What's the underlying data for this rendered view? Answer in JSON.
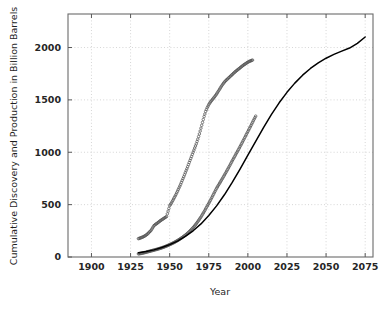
{
  "chart_data": {
    "type": "line",
    "title": "",
    "xlabel": "Year",
    "ylabel": "Cumulative Discovery and Production in Billion Barrels",
    "xlim": [
      1885,
      2080
    ],
    "ylim": [
      0,
      2320
    ],
    "xticks": [
      1900,
      1925,
      1950,
      1975,
      2000,
      2025,
      2050,
      2075
    ],
    "xtick_labels": [
      "1900",
      "1925",
      "1950",
      "1975",
      "2000",
      "2025",
      "2050",
      "2075"
    ],
    "yticks": [
      0,
      500,
      1000,
      1500,
      2000
    ],
    "ytick_labels": [
      "0",
      "500",
      "1000",
      "1500",
      "2000"
    ],
    "grid": "dotted-light-gray",
    "legend": "none",
    "series": [
      {
        "name": "Cumulative Discovery",
        "marker": "open-circle",
        "color": "#555555",
        "points": [
          [
            1930,
            175
          ],
          [
            1931,
            180
          ],
          [
            1932,
            186
          ],
          [
            1933,
            192
          ],
          [
            1934,
            200
          ],
          [
            1935,
            210
          ],
          [
            1936,
            222
          ],
          [
            1937,
            238
          ],
          [
            1938,
            252
          ],
          [
            1940,
            300
          ],
          [
            1941,
            312
          ],
          [
            1942,
            322
          ],
          [
            1943,
            334
          ],
          [
            1944,
            346
          ],
          [
            1945,
            356
          ],
          [
            1946,
            366
          ],
          [
            1947,
            376
          ],
          [
            1948,
            386
          ],
          [
            1950,
            490
          ],
          [
            1951,
            512
          ],
          [
            1952,
            540
          ],
          [
            1953,
            568
          ],
          [
            1954,
            596
          ],
          [
            1955,
            628
          ],
          [
            1956,
            660
          ],
          [
            1957,
            694
          ],
          [
            1958,
            730
          ],
          [
            1959,
            766
          ],
          [
            1960,
            804
          ],
          [
            1961,
            842
          ],
          [
            1962,
            882
          ],
          [
            1963,
            922
          ],
          [
            1964,
            960
          ],
          [
            1965,
            1000
          ],
          [
            1966,
            1040
          ],
          [
            1967,
            1080
          ],
          [
            1968,
            1125
          ],
          [
            1969,
            1175
          ],
          [
            1970,
            1230
          ],
          [
            1971,
            1285
          ],
          [
            1972,
            1340
          ],
          [
            1973,
            1390
          ],
          [
            1974,
            1425
          ],
          [
            1975,
            1455
          ],
          [
            1976,
            1478
          ],
          [
            1977,
            1497
          ],
          [
            1978,
            1516
          ],
          [
            1979,
            1535
          ],
          [
            1980,
            1556
          ],
          [
            1981,
            1580
          ],
          [
            1982,
            1604
          ],
          [
            1983,
            1628
          ],
          [
            1984,
            1650
          ],
          [
            1985,
            1670
          ],
          [
            1986,
            1686
          ],
          [
            1987,
            1700
          ],
          [
            1988,
            1714
          ],
          [
            1989,
            1728
          ],
          [
            1990,
            1742
          ],
          [
            1991,
            1756
          ],
          [
            1992,
            1770
          ],
          [
            1993,
            1782
          ],
          [
            1994,
            1794
          ],
          [
            1995,
            1806
          ],
          [
            1996,
            1818
          ],
          [
            1997,
            1830
          ],
          [
            1998,
            1840
          ],
          [
            1999,
            1850
          ],
          [
            2000,
            1860
          ],
          [
            2001,
            1868
          ],
          [
            2002,
            1874
          ],
          [
            2003,
            1880
          ]
        ]
      },
      {
        "name": "Cumulative Production",
        "marker": "open-circle",
        "color": "#555555",
        "points": [
          [
            1930,
            30
          ],
          [
            1932,
            35
          ],
          [
            1934,
            42
          ],
          [
            1936,
            50
          ],
          [
            1938,
            58
          ],
          [
            1940,
            66
          ],
          [
            1942,
            74
          ],
          [
            1944,
            83
          ],
          [
            1946,
            93
          ],
          [
            1948,
            105
          ],
          [
            1950,
            118
          ],
          [
            1952,
            132
          ],
          [
            1954,
            148
          ],
          [
            1956,
            166
          ],
          [
            1958,
            186
          ],
          [
            1960,
            208
          ],
          [
            1962,
            234
          ],
          [
            1964,
            264
          ],
          [
            1966,
            298
          ],
          [
            1968,
            338
          ],
          [
            1970,
            382
          ],
          [
            1972,
            432
          ],
          [
            1974,
            486
          ],
          [
            1976,
            540
          ],
          [
            1978,
            598
          ],
          [
            1980,
            656
          ],
          [
            1982,
            706
          ],
          [
            1984,
            756
          ],
          [
            1986,
            808
          ],
          [
            1988,
            862
          ],
          [
            1990,
            918
          ],
          [
            1992,
            972
          ],
          [
            1994,
            1026
          ],
          [
            1996,
            1082
          ],
          [
            1998,
            1140
          ],
          [
            2000,
            1198
          ],
          [
            2002,
            1256
          ],
          [
            2004,
            1316
          ],
          [
            2005,
            1345
          ]
        ]
      },
      {
        "name": "Logistic Production Model",
        "marker": "solid-line",
        "color": "#000000",
        "asymptote": 2100,
        "midpoint_year": 2008,
        "points": [
          [
            1930,
            40
          ],
          [
            1935,
            52
          ],
          [
            1940,
            68
          ],
          [
            1945,
            90
          ],
          [
            1950,
            118
          ],
          [
            1955,
            152
          ],
          [
            1960,
            196
          ],
          [
            1965,
            250
          ],
          [
            1970,
            316
          ],
          [
            1975,
            396
          ],
          [
            1980,
            488
          ],
          [
            1985,
            594
          ],
          [
            1990,
            712
          ],
          [
            1995,
            840
          ],
          [
            2000,
            972
          ],
          [
            2005,
            1104
          ],
          [
            2010,
            1236
          ],
          [
            2015,
            1360
          ],
          [
            2020,
            1472
          ],
          [
            2025,
            1572
          ],
          [
            2030,
            1660
          ],
          [
            2035,
            1736
          ],
          [
            2040,
            1800
          ],
          [
            2045,
            1854
          ],
          [
            2050,
            1898
          ],
          [
            2055,
            1934
          ],
          [
            2060,
            1965
          ],
          [
            2065,
            1995
          ],
          [
            2070,
            2040
          ],
          [
            2075,
            2100
          ]
        ]
      }
    ]
  },
  "axes": {
    "frame_color": "#6b6b6b",
    "grid_color": "#cccccc",
    "background": "#ffffff"
  }
}
